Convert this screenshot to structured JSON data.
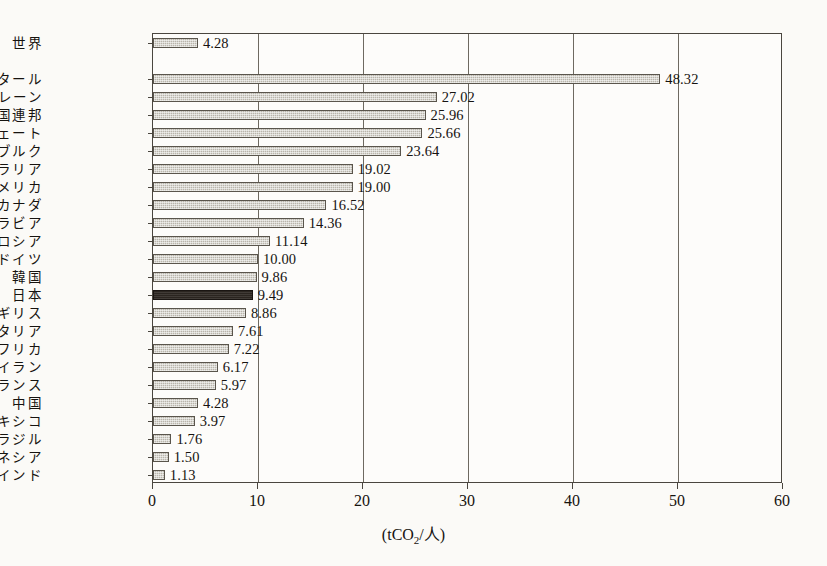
{
  "chart_data": {
    "type": "bar",
    "orientation": "horizontal",
    "title": "",
    "subtitle": "",
    "xlabel": "(tCO2/人)",
    "ylabel": "",
    "xlim": [
      0,
      60
    ],
    "xticks": [
      0,
      10,
      20,
      30,
      40,
      50,
      60
    ],
    "xtick_labels": [
      "0",
      "10",
      "20",
      "30",
      "40",
      "50",
      "60"
    ],
    "grid": true,
    "grid_axis": "x",
    "legend": false,
    "legend_position": "none",
    "categories": [
      "世界",
      "カタール",
      "バーレーン",
      "アラブ首長国連邦",
      "クウェート",
      "ルクセンブルク",
      "オーストラリア",
      "アメリカ",
      "カナダ",
      "サウジアラビア",
      "ロシア",
      "ドイツ",
      "韓国",
      "日本",
      "イギリス",
      "イタリア",
      "南アフリカ",
      "イラン",
      "フランス",
      "中国",
      "メキシコ",
      "ブラジル",
      "インドネシア",
      "インド"
    ],
    "values": [
      4.28,
      48.32,
      27.02,
      25.96,
      25.66,
      23.64,
      19.02,
      19.0,
      16.52,
      14.36,
      11.14,
      10.0,
      9.86,
      9.49,
      8.86,
      7.61,
      7.22,
      6.17,
      5.97,
      4.28,
      3.97,
      1.76,
      1.5,
      1.13
    ],
    "value_labels": [
      "4.28",
      "48.32",
      "27.02",
      "25.96",
      "25.66",
      "23.64",
      "19.02",
      "19.00",
      "16.52",
      "14.36",
      "11.14",
      "10.00",
      "9.86",
      "9.49",
      "8.86",
      "7.61",
      "7.22",
      "6.17",
      "5.97",
      "4.28",
      "3.97",
      "1.76",
      "1.50",
      "1.13"
    ],
    "highlight_index": 13,
    "highlight_category": "日本",
    "separator_after_index": 0,
    "colors": {
      "bar_fill": "#b9b5ab",
      "bar_edge": "#5a554c",
      "highlight_fill": "#2b2520",
      "axis": "#4a463f",
      "grid": "#6e6960",
      "text": "#16130f",
      "background": "#fbfaf7",
      "plot_background": "#fdfcfa"
    }
  },
  "axis": {
    "unit_prefix": "(tCO",
    "unit_sub": "2",
    "unit_suffix": "/人)"
  }
}
